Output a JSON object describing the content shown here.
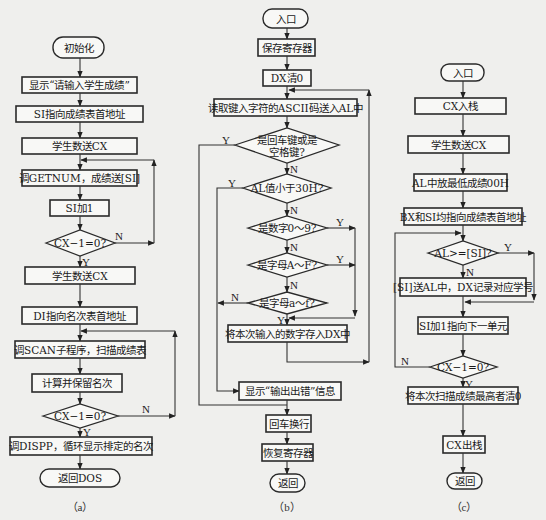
{
  "labels": {
    "yes": "Y",
    "no": "N"
  },
  "a": {
    "caption": "（a）",
    "nodes": [
      "初始化",
      "显示“请输入学生成绩”",
      "SI指向成绩表首地址",
      "学生数送CX",
      "调GETNUM，成绩送[SI]",
      "SI加1",
      "CX−1=0?",
      "学生数送CX",
      "DI指向名次表首地址",
      "调SCAN子程序，扫描成绩表",
      "计算并保留名次",
      "CX−1=0?",
      "调DISPP，循环显示排定的名次",
      "返回DOS"
    ]
  },
  "b": {
    "caption": "（b）",
    "nodes": [
      "入口",
      "保存寄存器",
      "DX清0",
      "读取键入字符的ASCII码送入AL中",
      [
        "是回车键或是",
        "空格键?"
      ],
      "AL值小于30H?",
      "是数字0～9?",
      "是字母A～F?",
      "是字母a～f?",
      "将本次输入的数字存入DX中",
      "显示“输出出错”信息",
      "回车换行",
      "恢复寄存器",
      "返回"
    ]
  },
  "c": {
    "caption": "（c）",
    "nodes": [
      "入口",
      "CX入栈",
      "学生数送CX",
      "AL中放最低成绩00H",
      "BX和SI均指向成绩表首地址",
      "AL>=[SI]?",
      "[SI]送AL中，DX记录对应学号",
      "SI加1指向下一单元",
      "CX−1=0?",
      "将本次扫描成绩最高者清0",
      "CX出栈",
      "返回"
    ]
  }
}
